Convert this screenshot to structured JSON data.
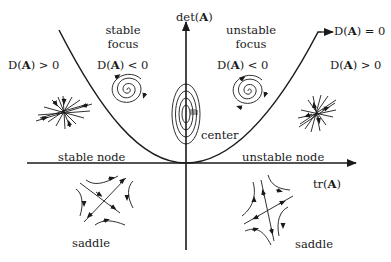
{
  "axes": {
    "y_label_prefix": "det(",
    "y_label_bold": "A",
    "y_label_suffix": ")",
    "x_label_prefix": "tr(",
    "x_label_bold": "A",
    "x_label_suffix": ")"
  },
  "regions": {
    "stable_focus": {
      "line1": "stable",
      "line2": "focus"
    },
    "unstable_focus": {
      "line1": "unstable",
      "line2": "focus"
    },
    "center": "center",
    "stable_node": "stable node",
    "unstable_node": "unstable node",
    "saddle_left": "saddle",
    "saddle_right": "saddle"
  },
  "discriminant": {
    "left_outer": {
      "prefix": "D(",
      "bold": "A",
      "suffix": ") > 0"
    },
    "left_inner": {
      "prefix": "D(",
      "bold": "A",
      "suffix": ") < 0"
    },
    "right_inner": {
      "prefix": "D(",
      "bold": "A",
      "suffix": ") < 0"
    },
    "right_outer": {
      "prefix": "D(",
      "bold": "A",
      "suffix": ") > 0"
    },
    "curve": {
      "prefix": "D(",
      "bold": "A",
      "suffix": ") = 0"
    }
  },
  "colors": {
    "ink": "#1a1a1a",
    "background": "#ffffff"
  }
}
